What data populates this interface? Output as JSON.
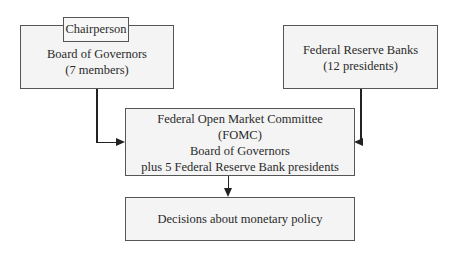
{
  "diagram": {
    "nodes": {
      "chairperson": {
        "label": "Chairperson"
      },
      "board": {
        "lines": [
          "Board of Governors",
          "(7 members)"
        ]
      },
      "banks": {
        "lines": [
          "Federal Reserve Banks",
          "(12 presidents)"
        ]
      },
      "fomc": {
        "lines": [
          "Federal Open Market Committee",
          "(FOMC)",
          "Board of Governors",
          "plus 5 Federal Reserve Bank presidents"
        ]
      },
      "decisions": {
        "lines": [
          "Decisions about monetary policy"
        ]
      }
    },
    "edges": [
      {
        "from": "board",
        "to": "fomc"
      },
      {
        "from": "banks",
        "to": "fomc"
      },
      {
        "from": "fomc",
        "to": "decisions"
      }
    ]
  }
}
